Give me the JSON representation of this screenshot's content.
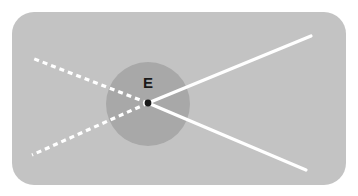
{
  "figure": {
    "name": "ray-diagram-virtual-image",
    "canvas": {
      "width": 358,
      "height": 196,
      "background_color": "#ffffff"
    },
    "panel": {
      "name": "diagram-panel",
      "x": 12,
      "y": 12,
      "width": 334,
      "height": 173,
      "corner_radius": 22,
      "fill_color": "#c3c3c3"
    },
    "region_circle": {
      "name": "shaded-region-circle",
      "center_x": 148,
      "center_y": 104,
      "radius": 42,
      "fill_color": "#a8a8a8"
    },
    "vertex": {
      "name": "convergence-point",
      "label": "E",
      "x": 148,
      "y": 103,
      "dot_radius": 3.4,
      "dot_color": "#1a1a1a",
      "label_x": 148,
      "label_y": 88,
      "label_color": "#1a1a1a"
    },
    "ray_color": "#ffffff",
    "ray_width": 3.2,
    "dash_pattern": "5 4",
    "rays": [
      {
        "name": "solid-ray-upper-right",
        "style": "solid",
        "x1": 148,
        "y1": 103,
        "x2": 311,
        "y2": 36
      },
      {
        "name": "solid-ray-lower-right",
        "style": "solid",
        "x1": 148,
        "y1": 103,
        "x2": 306,
        "y2": 170
      },
      {
        "name": "dashed-ray-upper-left",
        "style": "dashed",
        "x1": 148,
        "y1": 103,
        "x2": 32,
        "y2": 58
      },
      {
        "name": "dashed-ray-lower-left",
        "style": "dashed",
        "x1": 148,
        "y1": 103,
        "x2": 32,
        "y2": 155
      }
    ]
  }
}
